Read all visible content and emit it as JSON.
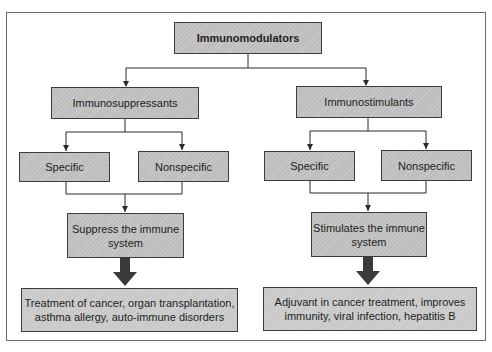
{
  "diagram": {
    "type": "flowchart",
    "root": {
      "label": "Immunomodulators"
    },
    "branches": [
      {
        "label": "Immunosuppressants",
        "children": [
          {
            "label": "Specific"
          },
          {
            "label": "Nonspecific"
          }
        ],
        "effect": {
          "label": "Suppress the immune system",
          "line1": "Suppress the immune",
          "line2": "system"
        },
        "uses": {
          "label": "Treatment of cancer, organ transplantation, asthma allergy, auto-immune disorders",
          "line1": "Treatment of cancer, organ transplantation,",
          "line2": "asthma allergy, auto-immune disorders"
        }
      },
      {
        "label": "Immunostimulants",
        "children": [
          {
            "label": "Specific"
          },
          {
            "label": "Nonspecific"
          }
        ],
        "effect": {
          "label": "Stimulates the immune system",
          "line1": "Stimulates the immune",
          "line2": "system"
        },
        "uses": {
          "label": "Adjuvant in cancer treatment, improves immunity, viral infection, hepatitis B",
          "line1": "Adjuvant in cancer treatment, improves",
          "line2": "immunity, viral infection, hepatitis B"
        }
      }
    ],
    "colors": {
      "box_fill": "#bdbdbd",
      "box_border": "#3c3c3c",
      "line": "#2a2a2a",
      "thick_arrow": "#3a3a3a",
      "frame_border": "#6a6a6a"
    }
  }
}
